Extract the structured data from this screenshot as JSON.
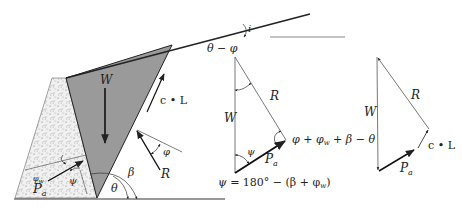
{
  "figure": {
    "colors": {
      "wedge_fill": "#9a9a9a",
      "wall_fill": "#ececec",
      "line": "#222222",
      "thin_line": "#555555"
    },
    "main_diagram": {
      "labels": {
        "weight": "W",
        "cohesion_force": "c • L",
        "resultant": "R",
        "friction_angle_R": "φ",
        "beta": "β",
        "theta": "θ",
        "active_thrust": "P",
        "active_thrust_sub": "a",
        "wall_friction_angle": "φ",
        "wall_friction_sub": "w",
        "psi": "ψ",
        "slope_angle": "i",
        "theta_minus_phi": "θ − φ"
      }
    },
    "polygon_1": {
      "labels": {
        "weight": "W",
        "resultant": "R",
        "psi": "ψ",
        "active_thrust": "P",
        "active_thrust_sub": "a",
        "tip_angle": "φ + φ",
        "tip_angle_sub": "w",
        "tip_angle_rest": " + β − θ",
        "psi_formula_prefix": "ψ",
        "psi_formula": " = 180° − (β + φ",
        "psi_formula_sub": "w",
        "psi_formula_close": ")"
      }
    },
    "polygon_2": {
      "labels": {
        "weight": "W",
        "resultant": "R",
        "active_thrust": "P",
        "active_thrust_sub": "a",
        "cohesion_force": "c • L"
      }
    }
  }
}
